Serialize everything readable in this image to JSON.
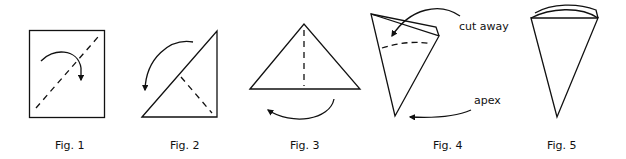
{
  "figures": [
    {
      "id": "fig1",
      "caption": "Fig. 1",
      "description": "Square with dashed diagonal fold line and curved arrow showing fold direction"
    },
    {
      "id": "fig2",
      "caption": "Fig. 2",
      "description": "Right triangle with dashed fold line and curved arrow"
    },
    {
      "id": "fig3",
      "caption": "Fig. 3",
      "description": "Isosceles triangle with vertical dashed fold line and curved arrow below"
    },
    {
      "id": "fig4",
      "caption": "Fig. 4",
      "description": "Folded cone with dashed arc cut line"
    },
    {
      "id": "fig5",
      "caption": "Fig. 5",
      "description": "Finished cone with curved top edge"
    }
  ],
  "annotations": {
    "cut_away": "cut away",
    "apex": "apex"
  },
  "colors": {
    "stroke": "#111111",
    "background": "#ffffff"
  }
}
